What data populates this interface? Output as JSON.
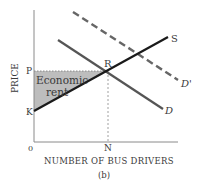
{
  "figure": {
    "caption": "(b)",
    "xlabel": "NUMBER OF BUS DRIVERS",
    "ylabel": "PRICE",
    "origin_label": "0",
    "y_ticks": {
      "P": "P",
      "K": "K"
    },
    "x_ticks": {
      "N": "N"
    },
    "equilibrium_label": "R",
    "shaded_region_label_line1": "Economic",
    "shaded_region_label_line2": "rent",
    "curves": {
      "supply": "S",
      "demand": "D",
      "demand_shifted": "D'"
    },
    "colors": {
      "axis": "#8a8a8a",
      "supply": "#1a1a1a",
      "demand": "#555555",
      "demand_shifted": "#666666",
      "shaded": "#bdbdbd",
      "guide": "#777777"
    }
  }
}
